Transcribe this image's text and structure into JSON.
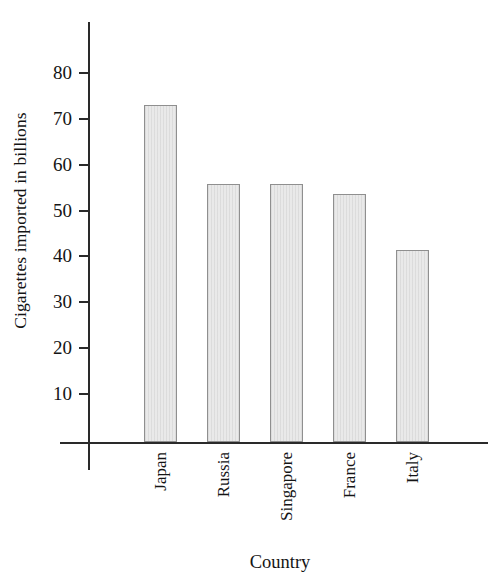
{
  "chart_data": {
    "type": "bar",
    "title": "",
    "xlabel": "Country",
    "ylabel": "Cigarettes imported in billions",
    "categories": [
      "Japan",
      "Russia",
      "Singapore",
      "France",
      "Italy"
    ],
    "values": [
      73.0,
      55.8,
      55.8,
      53.6,
      41.4
    ],
    "ylim": [
      0,
      85
    ],
    "yticks": [
      10,
      20,
      30,
      40,
      50,
      60,
      70,
      80
    ],
    "ytick_labels": [
      "10",
      "20",
      "30",
      "40",
      "50",
      "60",
      "70",
      "80"
    ],
    "grid": false,
    "legend": null,
    "bar_fill_color": "#e9e9e9",
    "bar_border_color": "#8f8f8f",
    "axis_color": "#2a2a2a"
  }
}
